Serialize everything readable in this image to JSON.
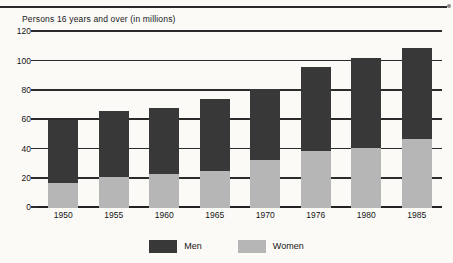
{
  "chart_data": {
    "type": "bar",
    "subtype": "stacked-bar",
    "title": "",
    "caption": "Persons 16 years and over (in millions)",
    "xlabel": "",
    "ylabel": "Persons 16 years and over (in millions)",
    "categories": [
      "1950",
      "1955",
      "1960",
      "1965",
      "1970",
      "1976",
      "1980",
      "1985"
    ],
    "series": [
      {
        "name": "Women",
        "color": "#b6b6b6",
        "values": [
          17,
          21,
          23,
          25,
          33,
          39,
          41,
          47
        ]
      },
      {
        "name": "Men",
        "color": "#383838",
        "values": [
          43,
          45,
          45,
          49,
          48,
          57,
          61,
          62
        ]
      }
    ],
    "totals": [
      60,
      66,
      68,
      74,
      81,
      96,
      102,
      109
    ],
    "ylim": [
      0,
      120
    ],
    "ytick_labels": [
      "0",
      "20",
      "40",
      "60",
      "80",
      "100",
      "120"
    ],
    "ytick_values": [
      0,
      20,
      40,
      60,
      80,
      100,
      120
    ],
    "grid": true,
    "legend_position": "bottom-center",
    "legend": [
      {
        "label": "Men",
        "color": "#383838"
      },
      {
        "label": "Women",
        "color": "#b6b6b6"
      }
    ]
  },
  "colors": {
    "men": "#383838",
    "women": "#b6b6b6",
    "axis": "#2b2b2b",
    "background": "#fbfaf7"
  }
}
